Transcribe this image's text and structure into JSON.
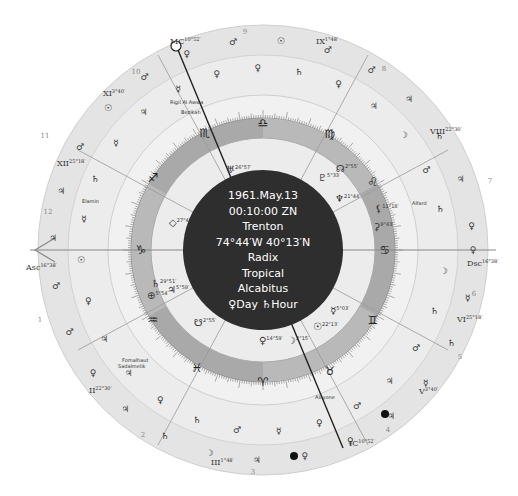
{
  "center": {
    "date": "1961.May.13",
    "time": "00:10:00 ZN",
    "place": "Trenton",
    "coords": "74°44′W 40°13′N",
    "chart_type": "Radix",
    "zodiac": "Tropical",
    "house_system": "Alcabitus",
    "day_hour": "♀Day ♄Hour"
  },
  "angles": {
    "asc": {
      "label": "Asc",
      "deg": "16°38′"
    },
    "dsc": {
      "label": "Dsc",
      "deg": "16°38′"
    },
    "mc": {
      "label": "MC",
      "deg": "10°52′"
    },
    "ic": {
      "label": "IC",
      "deg": "10°52′"
    }
  },
  "house_cusps": [
    {
      "label": "II",
      "deg": "22°30′"
    },
    {
      "label": "III",
      "deg": "1°48′"
    },
    {
      "label": "V",
      "deg": "3°40′"
    },
    {
      "label": "VI",
      "deg": "25°18′"
    },
    {
      "label": "VIII",
      "deg": "22°30′"
    },
    {
      "label": "IX",
      "deg": "1°48′"
    },
    {
      "label": "XI",
      "deg": "3°40′"
    },
    {
      "label": "XII",
      "deg": "25°18′"
    }
  ],
  "house_numbers": [
    "1",
    "2",
    "3",
    "4",
    "5",
    "6",
    "7",
    "8",
    "9",
    "10",
    "11",
    "12"
  ],
  "signs": [
    "♈",
    "♉",
    "♊",
    "♋",
    "♌",
    "♍",
    "♎",
    "♏",
    "♐",
    "♑",
    "♒",
    "♓"
  ],
  "fixed_stars": [
    "Rigil Al Awwa",
    "Bezikah",
    "Alfard",
    "Elamin",
    "Fomalhaut",
    "Sadalmelik",
    "Alcyone"
  ],
  "planets": [
    {
      "glyph": "♅",
      "deg": "26°57′",
      "retro": "R",
      "name": "uranus"
    },
    {
      "glyph": "♇",
      "deg": "5°33′",
      "retro": "R",
      "name": "pluto"
    },
    {
      "glyph": "☊",
      "deg": "2°55′",
      "name": "node"
    },
    {
      "glyph": "♆",
      "deg": "21°44′",
      "name": "neptune"
    },
    {
      "glyph": "⚸",
      "deg": "11°18′",
      "name": "lilith"
    },
    {
      "glyph": "⚳",
      "deg": "9°43′",
      "name": "ceres"
    },
    {
      "glyph": "⯏",
      "deg": "27°43′",
      "name": "vertex"
    },
    {
      "glyph": "♄",
      "deg": "29°51′",
      "retro": "R",
      "name": "saturn"
    },
    {
      "glyph": "♃",
      "deg": "5°59′",
      "name": "jupiter"
    },
    {
      "glyph": "⊕",
      "deg": "5°54′",
      "name": "fortune"
    },
    {
      "glyph": "☋",
      "deg": "2°55′",
      "name": "south-node"
    },
    {
      "glyph": "☿",
      "deg": "5°03′",
      "name": "mercury"
    },
    {
      "glyph": "☉",
      "deg": "22°13′",
      "name": "sun"
    },
    {
      "glyph": "♀",
      "deg": "14°59′",
      "name": "venus"
    },
    {
      "glyph": "☽",
      "deg": "2°15′",
      "name": "moon"
    }
  ],
  "ruler_ring_glyphs": [
    "♀",
    "☽",
    "☿",
    "♄",
    "♄",
    "♂",
    "☿",
    "♃",
    "♃",
    "♂",
    "♀",
    "♀",
    "♀",
    "☿",
    "♃",
    "♂",
    "☽",
    "♄",
    "♄",
    "♀",
    "♃",
    "♃",
    "♀",
    "♃",
    "♂",
    "♀",
    "♂",
    "☉",
    "♃",
    "☿",
    "♃",
    "♄",
    "♂",
    "☿",
    "☉",
    "♃",
    "♂",
    "☿",
    "♀",
    "♀",
    "♂",
    "♀",
    "☉",
    "♄",
    "♂",
    "♀",
    "♂",
    "♃",
    "♃",
    "☽",
    "♄",
    "♂",
    "♃",
    "♄",
    "♀"
  ],
  "colors": {
    "center_disc": "#2e2e2e",
    "sign_ring": "#a9a9a9",
    "sign_ring_alt": "#b8b8b8",
    "inner_ring": "#e9e9e9",
    "outer_ring": "#dcdcdc",
    "outermost_ring": "#e6e6e6",
    "axis_line": "#888888"
  }
}
